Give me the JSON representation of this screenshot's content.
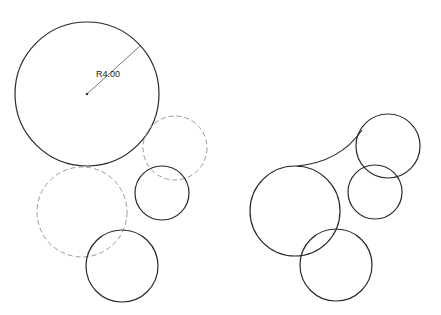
{
  "diagram": {
    "background": "#ffffff",
    "colors": {
      "solid": "#2a2a2a",
      "dashed": "#9a9a9a"
    },
    "left_group": {
      "circles": [
        {
          "id": "large-circle",
          "cx": 87,
          "cy": 94,
          "r": 72,
          "style": "solid"
        },
        {
          "id": "dashed-circle-upper",
          "cx": 175,
          "cy": 148,
          "r": 32,
          "style": "dashed"
        },
        {
          "id": "small-circle",
          "cx": 162,
          "cy": 193,
          "r": 27,
          "style": "solid"
        },
        {
          "id": "dashed-circle-lower",
          "cx": 82,
          "cy": 212,
          "r": 45,
          "style": "dashed"
        },
        {
          "id": "bottom-circle",
          "cx": 122,
          "cy": 266,
          "r": 36,
          "style": "solid"
        }
      ],
      "dimension": {
        "label": "R4.00",
        "from": [
          87,
          94
        ],
        "to": [
          140,
          46
        ],
        "label_x": 96,
        "label_y": 77
      }
    },
    "right_group": {
      "circles": [
        {
          "id": "large-circle",
          "cx": 295,
          "cy": 211,
          "r": 45,
          "style": "solid"
        },
        {
          "id": "upper-right-circle",
          "cx": 388,
          "cy": 146,
          "r": 32,
          "style": "solid"
        },
        {
          "id": "middle-small-circle",
          "cx": 375,
          "cy": 192,
          "r": 27,
          "style": "solid"
        },
        {
          "id": "bottom-circle",
          "cx": 336,
          "cy": 265,
          "r": 36,
          "style": "solid"
        }
      ],
      "fillet_arc": {
        "path": "M 297 166 Q 340 162 362 130"
      }
    }
  }
}
